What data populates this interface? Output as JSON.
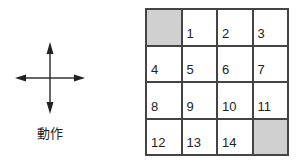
{
  "action": {
    "label": "動作",
    "icon": "four-direction-arrows-icon"
  },
  "puzzle": {
    "rows": 4,
    "cols": 4,
    "blank_color": "#d0d0d0",
    "cells": [
      "",
      "1",
      "2",
      "3",
      "4",
      "5",
      "6",
      "7",
      "8",
      "9",
      "10",
      "11",
      "12",
      "13",
      "14",
      ""
    ],
    "blank_indices": [
      0,
      15
    ]
  }
}
